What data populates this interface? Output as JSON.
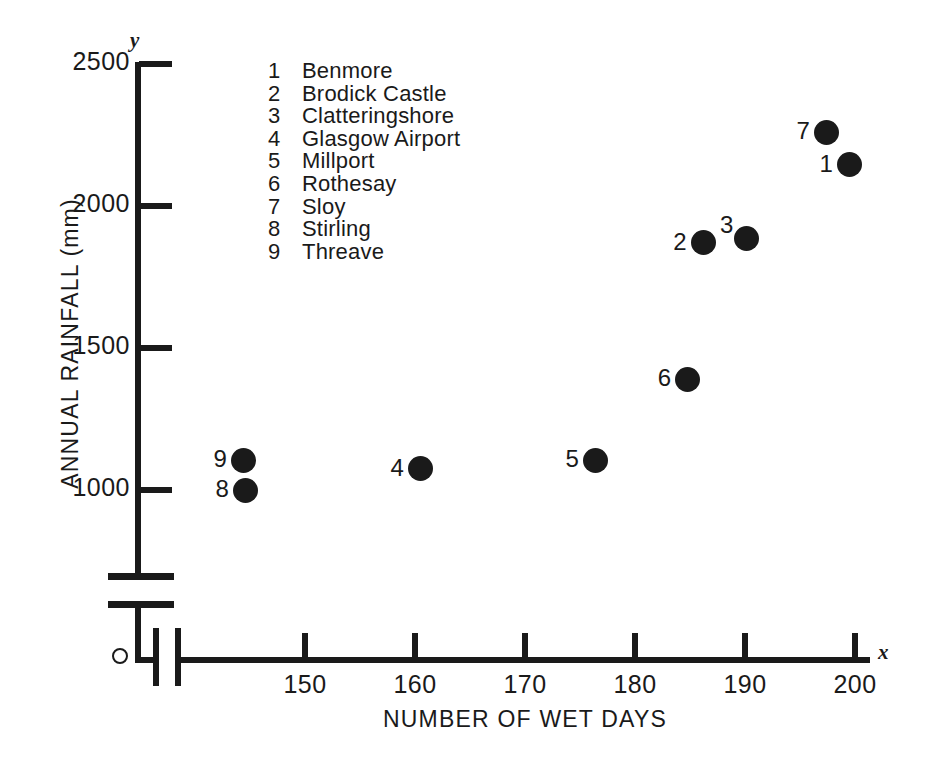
{
  "chart_data": {
    "type": "scatter",
    "title": "",
    "xlabel": "NUMBER OF WET DAYS",
    "ylabel": "ANNUAL RAINFALL (mm)",
    "x_axis_letter": "x",
    "y_axis_letter": "y",
    "origin_marker": "O",
    "xlim": [
      142,
      204
    ],
    "ylim": [
      950,
      2500
    ],
    "x_ticks": [
      150,
      160,
      170,
      180,
      190,
      200
    ],
    "x_tick_labels": [
      "150",
      "160",
      "170",
      "180",
      "190",
      "200"
    ],
    "y_ticks": [
      1000,
      1500,
      2000,
      2500
    ],
    "y_tick_labels": [
      "1000",
      "1500",
      "2000",
      "2500"
    ],
    "grid": false,
    "axis_break_y": true,
    "axis_break_x": true,
    "marker": "filled-circle",
    "marker_color": "#1a1a1a",
    "points": [
      {
        "key": "1",
        "name": "Benmore",
        "x": 199.5,
        "y": 2145,
        "label_side": "left"
      },
      {
        "key": "2",
        "name": "Brodick Castle",
        "x": 186.2,
        "y": 1870,
        "label_side": "left"
      },
      {
        "key": "3",
        "name": "Clatteringshore",
        "x": 190.1,
        "y": 1885,
        "label_side": "left-up"
      },
      {
        "key": "4",
        "name": "Glasgow Airport",
        "x": 160.5,
        "y": 1075,
        "label_side": "left"
      },
      {
        "key": "5",
        "name": "Millport",
        "x": 176.4,
        "y": 1105,
        "label_side": "left"
      },
      {
        "key": "6",
        "name": "Rothesay",
        "x": 184.8,
        "y": 1390,
        "label_side": "left"
      },
      {
        "key": "7",
        "name": "Sloy",
        "x": 197.4,
        "y": 2260,
        "label_side": "left"
      },
      {
        "key": "8",
        "name": "Stirling",
        "x": 144.6,
        "y": 1000,
        "label_side": "left"
      },
      {
        "key": "9",
        "name": "Threave",
        "x": 144.4,
        "y": 1105,
        "label_side": "left"
      }
    ]
  },
  "legend": {
    "entries": [
      {
        "key": "1",
        "name": "Benmore"
      },
      {
        "key": "2",
        "name": "Brodick Castle"
      },
      {
        "key": "3",
        "name": "Clatteringshore"
      },
      {
        "key": "4",
        "name": "Glasgow Airport"
      },
      {
        "key": "5",
        "name": "Millport"
      },
      {
        "key": "6",
        "name": "Rothesay"
      },
      {
        "key": "7",
        "name": "Sloy"
      },
      {
        "key": "8",
        "name": "Stirling"
      },
      {
        "key": "9",
        "name": "Threave"
      }
    ]
  }
}
